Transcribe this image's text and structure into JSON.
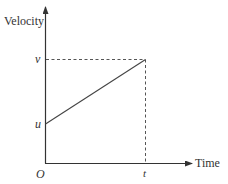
{
  "diagram": {
    "type": "velocity-time graph",
    "y_axis_label": "Velocity",
    "x_axis_label": "Time",
    "origin_label": "O",
    "initial_velocity_label": "u",
    "final_velocity_label": "v",
    "time_label": "t",
    "line": {
      "from": "u at time 0",
      "to": "v at time t",
      "style": "solid straight line"
    },
    "guides": [
      "horizontal dashed line from v to point (t, v)",
      "vertical dashed line from point (t, v) to t"
    ],
    "colors": {
      "axis": "#333333",
      "line": "#444444",
      "dashed": "#555555",
      "background": "#ffffff"
    }
  }
}
